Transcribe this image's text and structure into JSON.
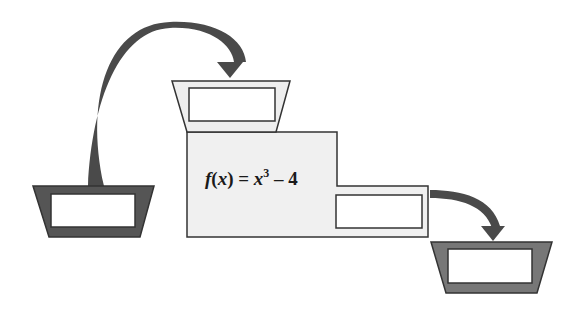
{
  "diagram": {
    "type": "function-machine",
    "formula": {
      "func_name": "f",
      "var": "x",
      "equals": "=",
      "base": "x",
      "exponent": "3",
      "operator": "–",
      "constant": "4"
    },
    "input_funnel": {
      "label": "",
      "fill": "#555555"
    },
    "machine_input_funnel": {
      "label": "",
      "fill": "#eeeeee"
    },
    "machine_output_box": {
      "label": ""
    },
    "output_funnel": {
      "label": "",
      "fill": "#777777"
    },
    "colors": {
      "outline": "#333333",
      "machine_fill": "#f0f0f0",
      "arrow": "#4a4a4a",
      "box_fill": "#ffffff"
    }
  }
}
